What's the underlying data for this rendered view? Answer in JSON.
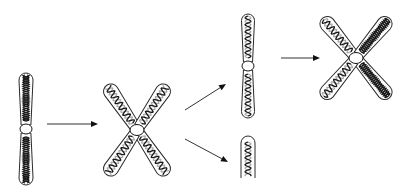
{
  "diagram": {
    "stages": [
      {
        "id": "unreplicated",
        "shape": "single-rod",
        "strands": 2,
        "pattern": "double-helix-coil",
        "color": "#1a1a1a"
      },
      {
        "id": "replicated-x",
        "shape": "x-four-arms",
        "strands": 2,
        "pattern": "dark-and-light-helix",
        "colors": [
          "#1a1a1a",
          "#a8a8a8"
        ]
      },
      {
        "id": "daughter-long",
        "shape": "single-rod",
        "strands": 2,
        "pattern": "dark-and-light-helix"
      },
      {
        "id": "daughter-fragment",
        "shape": "partial-rod",
        "strands": 2,
        "pattern": "dark-and-light-helix"
      },
      {
        "id": "replicated-x-second",
        "shape": "x-four-arms",
        "strands": 2,
        "pattern": "mixed-helix",
        "note": "left arms dark+light, right arms dark coil"
      }
    ],
    "arrows": [
      {
        "from": "unreplicated",
        "to": "replicated-x",
        "direction": "right"
      },
      {
        "from": "replicated-x",
        "to": "daughter-long",
        "direction": "up-right"
      },
      {
        "from": "replicated-x",
        "to": "daughter-fragment",
        "direction": "down-right"
      },
      {
        "from": "daughter-long",
        "to": "replicated-x-second",
        "direction": "right"
      }
    ],
    "colors": {
      "outline": "#2a2a2a",
      "dark_strand": "#1a1a1a",
      "light_strand": "#a8a8a8",
      "background": "#ffffff"
    }
  }
}
